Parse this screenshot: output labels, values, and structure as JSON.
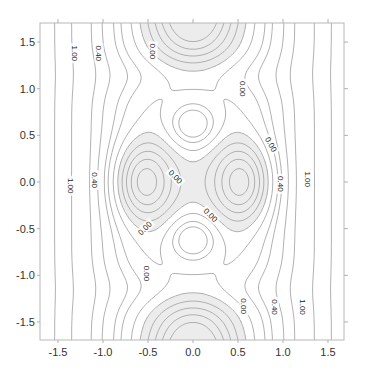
{
  "chart_data": {
    "type": "contour",
    "title": "",
    "xlabel": "",
    "ylabel": "",
    "xlim": [
      -1.7,
      1.7
    ],
    "ylim": [
      -1.7,
      1.7
    ],
    "x_ticks": [
      -1.5,
      -1.0,
      -0.5,
      0.0,
      0.5,
      1.0,
      1.5
    ],
    "x_tick_labels": [
      "-1.5",
      "-1.0",
      "-0.5",
      "0.0",
      "0.5",
      "1.0",
      "1.5"
    ],
    "y_ticks": [
      1.5,
      1.0,
      0.5,
      0.0,
      -0.5,
      -1.0,
      -1.5
    ],
    "y_tick_labels": [
      "1.5",
      "1.0",
      "0.5",
      "0.0",
      "-0.5",
      "-1.0",
      "-1.5"
    ],
    "grid": false,
    "legend": "none",
    "contour_levels": [
      -0.6,
      -0.45,
      -0.3,
      -0.15,
      0.0,
      0.15,
      0.3,
      0.4,
      0.55,
      0.7,
      1.0,
      1.3,
      1.6
    ],
    "labeled_levels": [
      {
        "text": "1.00",
        "x": -1.32,
        "y": 1.38,
        "rot": 90
      },
      {
        "text": "0.40",
        "x": -1.05,
        "y": 1.38,
        "rot": 90
      },
      {
        "text": "0.00",
        "x": -0.45,
        "y": 1.4,
        "rot": 90
      },
      {
        "text": "0.00",
        "x": 0.55,
        "y": 1.0,
        "rot": 90
      },
      {
        "text": "0.00",
        "x": -0.2,
        "y": 0.05,
        "rot": 45
      },
      {
        "text": "0.00",
        "x": 0.86,
        "y": 0.4,
        "rot": 60
      },
      {
        "text": "0.40",
        "x": 0.97,
        "y": -0.02,
        "rot": 90
      },
      {
        "text": "1.00",
        "x": 1.27,
        "y": 0.03,
        "rot": 90
      },
      {
        "text": "1.00",
        "x": -1.37,
        "y": -0.04,
        "rot": 90
      },
      {
        "text": "0.40",
        "x": -1.1,
        "y": 0.02,
        "rot": 90
      },
      {
        "text": "0.00",
        "x": 0.19,
        "y": -0.36,
        "rot": 45
      },
      {
        "text": "0.00",
        "x": -0.53,
        "y": -0.5,
        "rot": -45
      },
      {
        "text": "0.00",
        "x": -0.52,
        "y": -0.98,
        "rot": 90
      },
      {
        "text": "0.00",
        "x": 0.56,
        "y": -1.33,
        "rot": 90
      },
      {
        "text": "0.40",
        "x": 0.9,
        "y": -1.34,
        "rot": 90
      },
      {
        "text": "1.00",
        "x": 1.21,
        "y": -1.34,
        "rot": 90
      }
    ],
    "negative_fill_color": "#ececec",
    "line_color": "#a8a8a8",
    "field_model": {
      "description": "z = qx*x^2 + qy*y^2 + sum of gaussian terms (amp, cx, cy, sx, sy)",
      "qx": 0.55,
      "qy": 0.0,
      "terms": [
        {
          "amp": -0.85,
          "cx": 0.55,
          "cy": 0.0,
          "sx": 0.32,
          "sy": 0.42
        },
        {
          "amp": -0.85,
          "cx": -0.55,
          "cy": 0.0,
          "sx": 0.32,
          "sy": 0.42
        },
        {
          "amp": 0.55,
          "cx": 0.0,
          "cy": 0.62,
          "sx": 0.3,
          "sy": 0.28
        },
        {
          "amp": 0.55,
          "cx": 0.0,
          "cy": -0.62,
          "sx": 0.3,
          "sy": 0.28
        },
        {
          "amp": -0.95,
          "cx": 0.0,
          "cy": 1.9,
          "sx": 0.48,
          "sy": 0.62
        },
        {
          "amp": -0.95,
          "cx": 0.0,
          "cy": -1.9,
          "sx": 0.48,
          "sy": 0.62
        },
        {
          "amp": 0.25,
          "cx": 0.0,
          "cy": 1.15,
          "sx": 0.9,
          "sy": 0.25
        },
        {
          "amp": 0.25,
          "cx": 0.0,
          "cy": -1.15,
          "sx": 0.9,
          "sy": 0.25
        }
      ]
    }
  }
}
